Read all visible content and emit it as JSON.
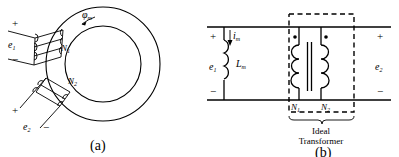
{
  "figure": {
    "panels": [
      {
        "id": "a",
        "caption": "(a)",
        "name": "toroidal-core-diagram",
        "labels": {
          "flux": "φ",
          "flux_sub": "m",
          "winding1": "N",
          "winding1_sub": "1",
          "winding2": "N",
          "winding2_sub": "2",
          "emf1": "e",
          "emf1_sub": "1",
          "emf2": "e",
          "emf2_sub": "2",
          "plus": "+",
          "minus": "−"
        },
        "elements": {
          "core_shape": "annulus-toroid",
          "flux_arrow_direction": "counterclockwise",
          "primary_turns_drawn": 3,
          "secondary_turns_drawn": 3
        }
      },
      {
        "id": "b",
        "caption": "(b)",
        "name": "equivalent-circuit-diagram",
        "labels": {
          "magnetizing_current": "i",
          "magnetizing_current_sub": "m",
          "magnetizing_inductance": "L",
          "magnetizing_inductance_sub": "m",
          "emf1": "e",
          "emf1_sub": "1",
          "emf2": "e",
          "emf2_sub": "2",
          "winding1": "N",
          "winding1_sub": "1",
          "winding2": "N",
          "winding2_sub": "2",
          "plus_left": "+",
          "minus_left": "−",
          "plus_right": "+",
          "minus_right": "−",
          "ideal_line1": "Ideal",
          "ideal_line2": "Transformer"
        },
        "elements": {
          "dashed_box": true,
          "polarity_dots": 2,
          "inductor_loops": 3,
          "primary_coil_loops": 3,
          "secondary_coil_loops": 3,
          "core_bars": 2
        }
      }
    ],
    "colors": {
      "line": "#000000",
      "background": "#ffffff"
    }
  }
}
